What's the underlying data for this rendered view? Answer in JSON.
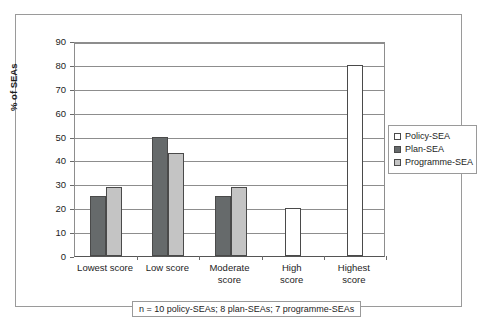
{
  "chart_data": {
    "type": "bar",
    "title": "",
    "xlabel": "",
    "ylabel": "% of SEAs",
    "ylim": [
      0,
      90
    ],
    "ytick_step": 10,
    "yticks": [
      0,
      10,
      20,
      30,
      40,
      50,
      60,
      70,
      80,
      90
    ],
    "grid": true,
    "legend_position": "right",
    "categories": [
      "Lowest score",
      "Low score",
      "Moderate score",
      "High score",
      "Highest score"
    ],
    "series": [
      {
        "name": "Policy-SEA",
        "color": "#ffffff",
        "values": [
          0,
          0,
          0,
          20,
          80
        ]
      },
      {
        "name": "Plan-SEA",
        "color": "#666a6b",
        "values": [
          25,
          50,
          25,
          0,
          0
        ]
      },
      {
        "name": "Programme-SEA",
        "color": "#c4c4c4",
        "values": [
          29,
          43,
          29,
          0,
          0
        ]
      }
    ],
    "footnote": "n = 10 policy-SEAs; 8 plan-SEAs; 7 programme-SEAs"
  },
  "legend": {
    "items": [
      {
        "label": "Policy-SEA"
      },
      {
        "label": "Plan-SEA"
      },
      {
        "label": "Programme-SEA"
      }
    ]
  },
  "axis": {
    "y_title": "% of SEAs",
    "y_labels": [
      "90",
      "80",
      "70",
      "60",
      "50",
      "40",
      "30",
      "20",
      "10",
      "0"
    ]
  },
  "x_axis": {
    "labels": [
      {
        "line1": "Lowest score",
        "line2": ""
      },
      {
        "line1": "Low score",
        "line2": ""
      },
      {
        "line1": "Moderate",
        "line2": "score"
      },
      {
        "line1": "High",
        "line2": "score"
      },
      {
        "line1": "Highest",
        "line2": "score"
      }
    ]
  },
  "footnote": {
    "text": "n = 10 policy-SEAs; 8 plan-SEAs; 7 programme-SEAs"
  },
  "colors": {
    "policy": "#ffffff",
    "plan": "#666a6b",
    "programme": "#c4c4c4",
    "bar_border": "#4a4a4a",
    "grid": "#8d8d8d",
    "frame": "#9a9a9a"
  }
}
